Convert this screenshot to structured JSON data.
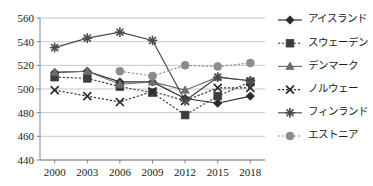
{
  "chart_data": {
    "type": "line",
    "title": "",
    "subtitle": "",
    "xlabel": "",
    "ylabel": "",
    "categories": [
      "2000",
      "2003",
      "2006",
      "2009",
      "2012",
      "2015",
      "2018"
    ],
    "x": [
      2000,
      2003,
      2006,
      2009,
      2012,
      2015,
      2018
    ],
    "ylim": [
      440,
      560
    ],
    "yticks": [
      440,
      460,
      480,
      500,
      520,
      540,
      560
    ],
    "grid": true,
    "legend_position": "right",
    "series": [
      {
        "name": "アイスランド",
        "marker": "diamond",
        "line_style": "solid",
        "color": "#2b2b2b",
        "values": [
          514,
          515,
          506,
          506,
          492,
          488,
          494
        ]
      },
      {
        "name": "スウェーデン",
        "marker": "square",
        "line_style": "dashed",
        "color": "#3d3d3d",
        "values": [
          510,
          509,
          502,
          497,
          478,
          494,
          506
        ]
      },
      {
        "name": "デンマーク",
        "marker": "triangle",
        "line_style": "solid",
        "color": "#6e6e6e",
        "values": [
          514,
          515,
          504,
          506,
          499,
          510,
          507
        ]
      },
      {
        "name": "ノルウェー",
        "marker": "cross",
        "line_style": "dashed",
        "color": "#2b2b2b",
        "values": [
          499,
          494,
          489,
          498,
          490,
          501,
          501
        ]
      },
      {
        "name": "フィンランド",
        "marker": "star",
        "line_style": "solid",
        "color": "#4a4a4a",
        "values": [
          535,
          543,
          548,
          541,
          490,
          510,
          507
        ]
      },
      {
        "name": "エストニア",
        "marker": "circle",
        "line_style": "dashed",
        "color": "#8c8c8c",
        "values": [
          null,
          null,
          515,
          511,
          520,
          519,
          522
        ]
      }
    ]
  },
  "legend": {
    "items": [
      {
        "label": "アイスランド"
      },
      {
        "label": "スウェーデン"
      },
      {
        "label": "デンマーク"
      },
      {
        "label": "ノルウェー"
      },
      {
        "label": "フィンランド"
      },
      {
        "label": "エストニア"
      }
    ]
  }
}
